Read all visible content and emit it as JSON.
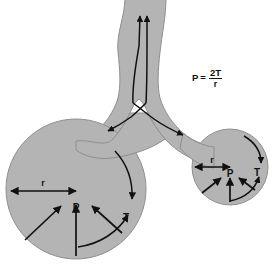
{
  "diagram": {
    "background_color": "#ffffff",
    "tissue_color": "#b4b4b4",
    "tissue_outline_color": "#8f8f8f",
    "vector_color": "#111111"
  },
  "formula": {
    "lhs": "P",
    "equals": "=",
    "numerator": "2T",
    "denominator": "r"
  },
  "large_alveolus": {
    "radius_label": "r",
    "pressure_label": "P",
    "tension_label": "T"
  },
  "small_alveolus": {
    "radius_label": "r",
    "pressure_label": "P",
    "tension_label": "T"
  }
}
